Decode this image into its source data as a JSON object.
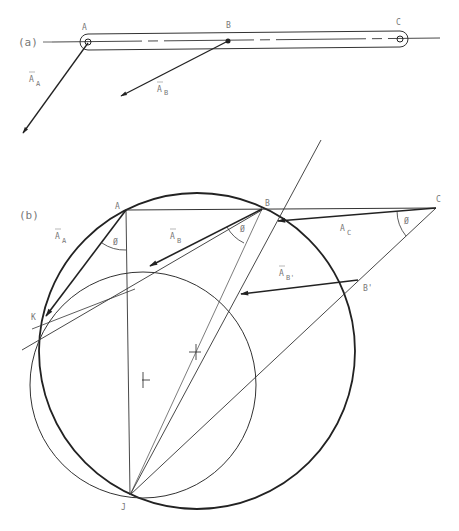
{
  "figure": {
    "panel_a": {
      "label": "(a)",
      "points": {
        "A": {
          "label": "A",
          "x": 88,
          "y": 42
        },
        "B": {
          "label": "B",
          "x": 228,
          "y": 41
        },
        "C": {
          "label": "C",
          "x": 400,
          "y": 39
        }
      },
      "vectors": {
        "A_A": {
          "label": "A",
          "subscript": "A"
        },
        "A_B": {
          "label": "A",
          "subscript": "B"
        }
      }
    },
    "panel_b": {
      "label": "(b)",
      "points": {
        "A": {
          "label": "A",
          "x": 126,
          "y": 210
        },
        "B": {
          "label": "B",
          "x": 262,
          "y": 209
        },
        "C": {
          "label": "C",
          "x": 436,
          "y": 208
        },
        "K": {
          "label": "K",
          "x": 43,
          "y": 320
        },
        "J": {
          "label": "J",
          "x": 130,
          "y": 495
        },
        "B_prime": {
          "label": "B'",
          "x": 358,
          "y": 280
        }
      },
      "vectors": {
        "A_A": {
          "label": "A",
          "subscript": "A"
        },
        "A_B": {
          "label": "A",
          "subscript": "B"
        },
        "A_C": {
          "label": "A",
          "subscript": "C"
        },
        "A_Bprime": {
          "label": "A",
          "subscript": "B'"
        }
      },
      "angle_symbol": "Ø",
      "circles": {
        "large": {
          "cx": 197,
          "cy": 351,
          "r": 158
        },
        "small": {
          "cx": 143,
          "cy": 385,
          "r": 113
        }
      }
    },
    "colors": {
      "ink": "#222222",
      "label": "#777777",
      "background": "#ffffff"
    }
  }
}
